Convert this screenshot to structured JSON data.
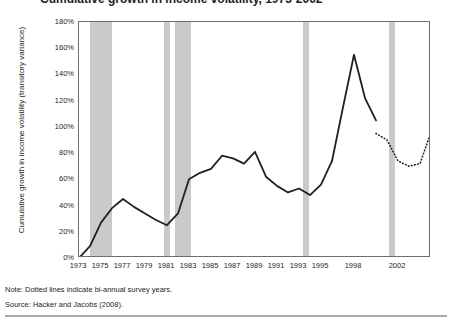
{
  "figure": {
    "title": "Cumulative growth in income volatility, 1973-2002",
    "note": "Note: Dotted lines indicate bi-annual survey years.",
    "source": "Source: Hacker and Jacobs (2008).",
    "colors": {
      "line": "#231f20",
      "band": "#c9cacb",
      "frame": "#6d6e71",
      "background": "#ffffff",
      "text": "#231f20"
    }
  },
  "chart_data": {
    "type": "line",
    "title": "Cumulative growth in income volatility, 1973-2002",
    "xlabel": "",
    "ylabel": "Cumulative growth in income volatility (transitory variance)",
    "xlim": [
      1973,
      2002
    ],
    "ylim": [
      0,
      180
    ],
    "ytick_values": [
      0,
      20,
      40,
      60,
      80,
      100,
      120,
      140,
      160,
      180
    ],
    "ytick_labels": [
      "0%",
      "20%",
      "40%",
      "60%",
      "80%",
      "100%",
      "120%",
      "140%",
      "160%",
      "180%"
    ],
    "xtick_values": [
      1973,
      1975,
      1977,
      1979,
      1981,
      1983,
      1985,
      1987,
      1989,
      1991,
      1993,
      1995,
      1998,
      2002
    ],
    "xtick_labels": [
      "1973",
      "1975",
      "1977",
      "1979",
      "1981",
      "1983",
      "1985",
      "1987",
      "1989",
      "1991",
      "1993",
      "1995",
      "1998",
      "2002"
    ],
    "grid": false,
    "legend": null,
    "series": [
      {
        "name": "Cumulative growth in income volatility",
        "style": "solid",
        "x": [
          1973,
          1974,
          1975,
          1976,
          1977,
          1978,
          1979,
          1980,
          1981,
          1982,
          1983,
          1984,
          1985,
          1986,
          1987,
          1988,
          1989,
          1990,
          1991,
          1992,
          1993,
          1994,
          1995,
          1996
        ],
        "values": [
          0,
          9,
          27,
          38,
          45,
          39,
          34,
          29,
          25,
          34,
          60,
          65,
          68,
          78,
          76,
          72,
          81,
          62,
          55,
          50,
          53,
          48,
          56,
          74
        ]
      },
      {
        "name": "Cumulative growth in income volatility (continued)",
        "style": "solid",
        "x": [
          1996,
          1997,
          1998,
          1999,
          2000
        ],
        "values": [
          74,
          115,
          155,
          122,
          105
        ]
      },
      {
        "name": "Bi-annual survey years (dotted)",
        "style": "dotted",
        "x": [
          2000,
          2001,
          2002,
          2003,
          2004,
          2005
        ],
        "values": [
          95,
          90,
          74,
          70,
          72,
          96
        ]
      }
    ],
    "peak": {
      "x": 1993,
      "value": 155
    },
    "shaded_bands": [
      {
        "start": 1974.0,
        "end": 1976.0,
        "label": "recession"
      },
      {
        "start": 1980.75,
        "end": 1981.3,
        "label": "recession"
      },
      {
        "start": 1981.7,
        "end": 1983.2,
        "label": "recession"
      },
      {
        "start": 1993.4,
        "end": 1993.9,
        "label": "recession"
      },
      {
        "start": 2001.2,
        "end": 2001.7,
        "label": "recession"
      }
    ]
  }
}
